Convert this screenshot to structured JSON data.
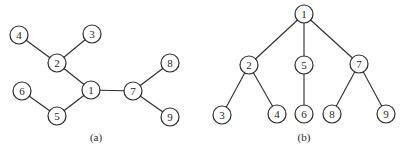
{
  "figure": {
    "width": 408,
    "height": 155,
    "background_color": "#ffffff",
    "stroke_color": "#2b2b2b",
    "node_fill_color": "#ffffff",
    "text_color": "#1f1f1f",
    "node_radius": 9,
    "graphs": [
      {
        "name": "graph-a",
        "label": "(a)",
        "label_x": 96,
        "label_y": 141,
        "nodes": [
          {
            "id": "4",
            "x": 19,
            "y": 35
          },
          {
            "id": "3",
            "x": 92,
            "y": 34
          },
          {
            "id": "2",
            "x": 57,
            "y": 63
          },
          {
            "id": "8",
            "x": 170,
            "y": 63
          },
          {
            "id": "6",
            "x": 22,
            "y": 91
          },
          {
            "id": "1",
            "x": 91,
            "y": 90
          },
          {
            "id": "7",
            "x": 133,
            "y": 91
          },
          {
            "id": "5",
            "x": 57,
            "y": 116
          },
          {
            "id": "9",
            "x": 170,
            "y": 117
          }
        ],
        "edges": [
          [
            "2",
            "4"
          ],
          [
            "2",
            "3"
          ],
          [
            "1",
            "2"
          ],
          [
            "1",
            "5"
          ],
          [
            "5",
            "6"
          ],
          [
            "1",
            "7"
          ],
          [
            "7",
            "8"
          ],
          [
            "7",
            "9"
          ]
        ]
      },
      {
        "name": "graph-b",
        "label": "(b)",
        "label_x": 304,
        "label_y": 141,
        "nodes": [
          {
            "id": "1",
            "x": 304,
            "y": 14
          },
          {
            "id": "2",
            "x": 249,
            "y": 65
          },
          {
            "id": "5",
            "x": 304,
            "y": 65
          },
          {
            "id": "7",
            "x": 359,
            "y": 64
          },
          {
            "id": "3",
            "x": 222,
            "y": 115
          },
          {
            "id": "4",
            "x": 277,
            "y": 114
          },
          {
            "id": "6",
            "x": 304,
            "y": 114
          },
          {
            "id": "8",
            "x": 332,
            "y": 114
          },
          {
            "id": "9",
            "x": 386,
            "y": 114
          }
        ],
        "edges": [
          [
            "1",
            "2"
          ],
          [
            "1",
            "5"
          ],
          [
            "1",
            "7"
          ],
          [
            "2",
            "3"
          ],
          [
            "2",
            "4"
          ],
          [
            "5",
            "6"
          ],
          [
            "7",
            "8"
          ],
          [
            "7",
            "9"
          ]
        ]
      }
    ]
  }
}
